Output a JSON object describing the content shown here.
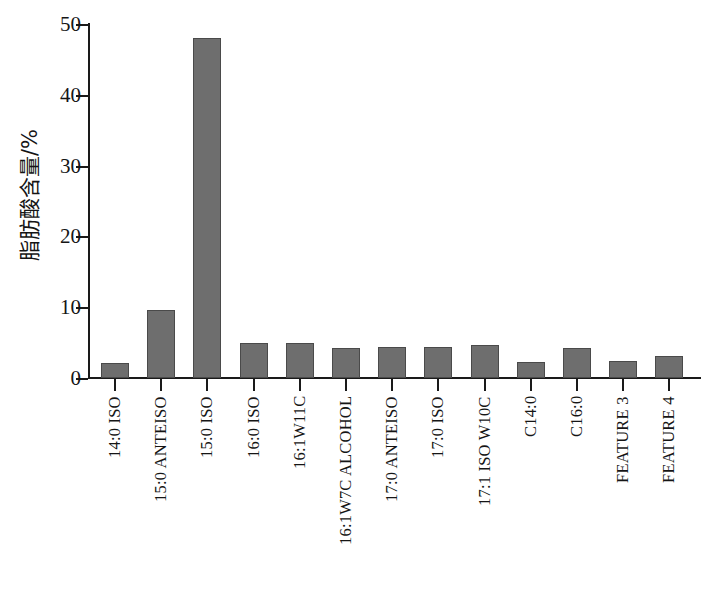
{
  "chart_data": {
    "type": "bar",
    "title": "",
    "xlabel": "",
    "ylabel": "脂肪酸含量/%",
    "ylim": [
      0,
      50
    ],
    "ytick_labels": [
      "0",
      "10",
      "20",
      "30",
      "40",
      "50"
    ],
    "ytick_values": [
      0,
      10,
      20,
      30,
      40,
      50
    ],
    "grid": false,
    "legend": null,
    "bar_color": "#6e6e6e",
    "bar_edge_color": "#4a4a4a",
    "axis_color": "#1a1a1a",
    "categories": [
      "14:0 ISO",
      "15:0 ANTEISO",
      "15:0 ISO",
      "16:0 ISO",
      "16:1W11C",
      "16:1W7C ALCOHOL",
      "17:0 ANTEISO",
      "17:0 ISO",
      "17:1 ISO W10C",
      "C14:0",
      "C16:0",
      "FEATURE 3",
      "FEATURE 4"
    ],
    "values": [
      2.1,
      9.6,
      48.0,
      4.9,
      4.9,
      4.2,
      4.4,
      4.4,
      4.7,
      2.2,
      4.2,
      2.4,
      3.1
    ]
  }
}
